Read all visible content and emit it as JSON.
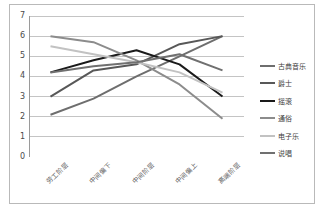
{
  "chart_data": {
    "type": "line",
    "title": "",
    "xlabel": "",
    "ylabel": "",
    "ylim": [
      0,
      7
    ],
    "ytick_labels": [
      "0",
      "1",
      "2",
      "3",
      "4",
      "5",
      "6",
      "7"
    ],
    "grid": true,
    "legend_position": "right",
    "categories": [
      "劳工阶层",
      "中间偏下",
      "中间阶层",
      "中间偏上",
      "高端阶层"
    ],
    "series": [
      {
        "name": "古典音乐",
        "color": "#6e6e6e",
        "width": 2.0,
        "values": [
          2.1,
          2.9,
          4.0,
          5.0,
          6.0
        ]
      },
      {
        "name": "爵士",
        "color": "#585858",
        "width": 2.0,
        "values": [
          3.0,
          4.3,
          4.6,
          5.6,
          6.0
        ]
      },
      {
        "name": "摇滚",
        "color": "#1a1a1a",
        "width": 2.0,
        "values": [
          4.2,
          4.8,
          5.3,
          4.6,
          3.0
        ]
      },
      {
        "name": "通俗",
        "color": "#8c8c8c",
        "width": 2.0,
        "values": [
          6.0,
          5.7,
          4.8,
          3.6,
          1.9
        ]
      },
      {
        "name": "电子乐",
        "color": "#c2c2c2",
        "width": 2.0,
        "values": [
          5.5,
          5.1,
          4.7,
          4.2,
          3.2
        ]
      },
      {
        "name": "说唱",
        "color": "#707070",
        "width": 2.0,
        "values": [
          4.2,
          4.5,
          4.7,
          5.1,
          4.3
        ]
      }
    ]
  },
  "legend": {
    "items": [
      {
        "label": "古典音乐"
      },
      {
        "label": "爵士"
      },
      {
        "label": "摇滚"
      },
      {
        "label": "通俗"
      },
      {
        "label": "电子乐"
      },
      {
        "label": "说唱"
      }
    ]
  },
  "colors": {
    "frame_border": "#b9b9b9",
    "gridline": "#b5b5b5",
    "axis": "#9a9a9a",
    "text": "#4a4a4a",
    "background": "#ffffff"
  }
}
